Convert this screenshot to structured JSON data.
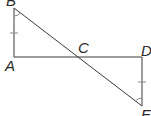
{
  "diagram": {
    "type": "geometry",
    "stroke_color": "#3a3a3a",
    "points": {
      "A": {
        "label": "A",
        "x": 14,
        "y": 57
      },
      "B": {
        "label": "B",
        "x": 14,
        "y": 8
      },
      "C": {
        "label": "C",
        "x": 77,
        "y": 57
      },
      "D": {
        "label": "D",
        "x": 142,
        "y": 57
      },
      "E": {
        "label": "E",
        "x": 142,
        "y": 106
      }
    },
    "segments": [
      "AB",
      "AD",
      "BE",
      "DE"
    ],
    "congruent_marks": [
      "AB",
      "DE"
    ],
    "congruent_angles": [
      "B",
      "E"
    ],
    "right_angles": [
      "A",
      "D"
    ]
  }
}
